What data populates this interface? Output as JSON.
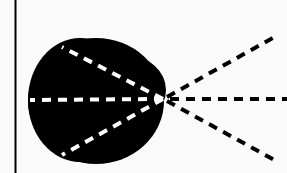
{
  "diagram": {
    "colors": {
      "background": "#fafafa",
      "blob": "#000000",
      "inner_rays": "#ffffff",
      "outer_rays": "#000000",
      "axis_line": "#000000"
    },
    "focal_point": {
      "x": 163,
      "y": 99
    },
    "inner_rays": [
      {
        "x": 30,
        "y": 100
      },
      {
        "x": 62,
        "y": 47
      },
      {
        "x": 62,
        "y": 155
      }
    ],
    "outer_rays": [
      {
        "x": 278,
        "y": 35
      },
      {
        "x": 287,
        "y": 99
      },
      {
        "x": 278,
        "y": 162
      }
    ]
  }
}
